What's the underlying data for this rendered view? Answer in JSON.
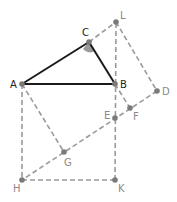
{
  "diagram": {
    "title": "",
    "colors": {
      "solid": "#1a1a1a",
      "dashed": "#9a9a9a",
      "point": "#7a7a7a",
      "angle_fill": "#9a9a9a",
      "label_dark": "#222222",
      "label_light": "#8a8a8a"
    },
    "points": {
      "A": {
        "label": "A",
        "x": 22,
        "y": 84
      },
      "B": {
        "label": "B",
        "x": 115,
        "y": 84
      },
      "C": {
        "label": "C",
        "x": 89,
        "y": 42
      },
      "L": {
        "label": "L",
        "x": 116,
        "y": 22
      },
      "D": {
        "label": "D",
        "x": 157,
        "y": 91
      },
      "E": {
        "label": "E",
        "x": 115,
        "y": 118
      },
      "F": {
        "label": "F",
        "x": 130,
        "y": 108
      },
      "G": {
        "label": "G",
        "x": 64,
        "y": 152
      },
      "H": {
        "label": "H",
        "x": 22,
        "y": 180
      },
      "K": {
        "label": "K",
        "x": 115,
        "y": 180
      }
    },
    "solid_segments": [
      "AB",
      "BC",
      "CA"
    ],
    "dashed_segments": [
      "AH",
      "HK",
      "KE",
      "EB",
      "BL",
      "CL",
      "LD",
      "DF",
      "FE",
      "EG",
      "GH",
      "AG",
      "BF"
    ],
    "angle_marker": "C"
  }
}
